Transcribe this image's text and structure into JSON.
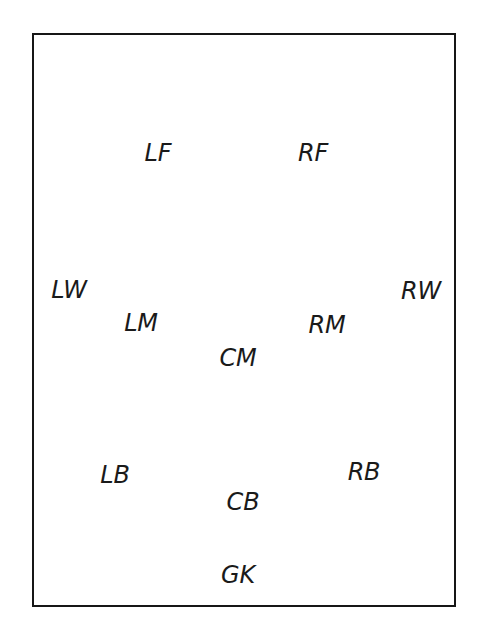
{
  "diagram": {
    "type": "soccer-position-layout",
    "background_color": "#ffffff",
    "border_color": "#161616",
    "text_color": "#1a1a1a",
    "pitch": {
      "x": 32,
      "y": 33,
      "width": 424,
      "height": 574,
      "border_width": 2
    },
    "positions": [
      {
        "code": "LF",
        "name": "left-forward",
        "cx": 158,
        "cy": 153
      },
      {
        "code": "RF",
        "name": "right-forward",
        "cx": 313,
        "cy": 153
      },
      {
        "code": "LW",
        "name": "left-wing",
        "cx": 69,
        "cy": 290
      },
      {
        "code": "RW",
        "name": "right-wing",
        "cx": 421,
        "cy": 291
      },
      {
        "code": "LM",
        "name": "left-midfield",
        "cx": 141,
        "cy": 323
      },
      {
        "code": "RM",
        "name": "right-midfield",
        "cx": 327,
        "cy": 325
      },
      {
        "code": "CM",
        "name": "center-midfield",
        "cx": 238,
        "cy": 358
      },
      {
        "code": "LB",
        "name": "left-back",
        "cx": 115,
        "cy": 475
      },
      {
        "code": "RB",
        "name": "right-back",
        "cx": 364,
        "cy": 472
      },
      {
        "code": "CB",
        "name": "center-back",
        "cx": 243,
        "cy": 502
      },
      {
        "code": "GK",
        "name": "goalkeeper",
        "cx": 238,
        "cy": 575
      }
    ]
  }
}
